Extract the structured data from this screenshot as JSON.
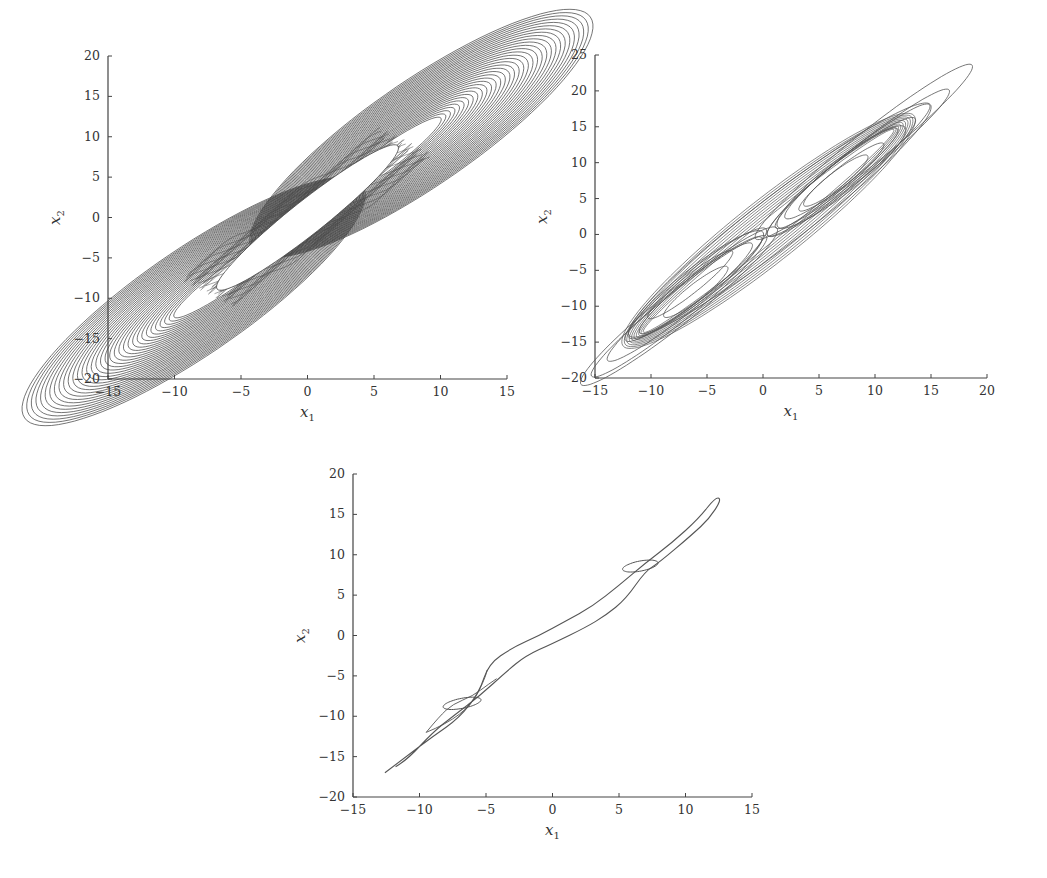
{
  "chart_data": [
    {
      "id": "plot-top-left",
      "type": "line",
      "title": "",
      "xlabel": "x1",
      "ylabel": "x2",
      "xlim": [
        -15,
        15
      ],
      "ylim": [
        -20,
        20
      ],
      "xticks": [
        -15,
        -10,
        -5,
        0,
        5,
        10,
        15
      ],
      "yticks": [
        -20,
        -15,
        -10,
        -5,
        0,
        5,
        10,
        15,
        20
      ],
      "grid": false,
      "legend": null,
      "description": "Dense phase portrait (many nested spiraling loops) forming a diagonal band from about (-14,-17) to (14,17), with a hollow central slot from about (-7,-9) to (7,9)",
      "series": [
        {
          "name": "trajectory",
          "shape": "dense-band",
          "outer_extent": {
            "x": [
              -14.5,
              14.2
            ],
            "y": [
              -17.5,
              17.7
            ]
          },
          "hole_extent": {
            "x": [
              -6.8,
              6.5
            ],
            "y": [
              -8.7,
              8.8
            ]
          }
        }
      ]
    },
    {
      "id": "plot-top-right",
      "type": "line",
      "title": "",
      "xlabel": "x1",
      "ylabel": "x2",
      "xlim": [
        -15,
        20
      ],
      "ylim": [
        -20,
        25
      ],
      "xticks": [
        -15,
        -10,
        -5,
        0,
        5,
        10,
        15,
        20
      ],
      "yticks": [
        -20,
        -15,
        -10,
        -5,
        0,
        5,
        10,
        15,
        20,
        25
      ],
      "grid": false,
      "legend": null,
      "description": "Double-scroll chaotic attractor with loops around approximately (-6,-7) and (7,8); outermost excursion reaches about (16,21) and (-14,-17)",
      "series": [
        {
          "name": "trajectory",
          "shape": "double-scroll",
          "extent": {
            "x": [
              -14,
              16
            ],
            "y": [
              -17.5,
              21.5
            ]
          },
          "foci": [
            [
              -6,
              -7
            ],
            [
              7,
              8
            ]
          ]
        }
      ]
    },
    {
      "id": "plot-bottom",
      "type": "line",
      "title": "",
      "xlabel": "x1",
      "ylabel": "x2",
      "xlim": [
        -15,
        15
      ],
      "ylim": [
        -20,
        20
      ],
      "xticks": [
        -15,
        -10,
        -5,
        0,
        5,
        10,
        15
      ],
      "yticks": [
        -20,
        -15,
        -10,
        -5,
        0,
        5,
        10,
        15,
        20
      ],
      "grid": false,
      "legend": null,
      "description": "Periodic orbit (few loops) elongated along the diagonal from about (-12.5,-17) to (12.5,17), with small inner loops near (-7,-8) and (7,8.5)",
      "series": [
        {
          "name": "trajectory",
          "shape": "limit-cycle",
          "extent": {
            "x": [
              -12.8,
              12.8
            ],
            "y": [
              -17.2,
              17.5
            ]
          },
          "small_loops": [
            [
              -7,
              -8.5
            ],
            [
              6.5,
              8.5
            ]
          ]
        }
      ]
    }
  ],
  "labels": {
    "x_main": "x",
    "x_sub": "1",
    "y_main": "x",
    "y_sub": "2"
  }
}
